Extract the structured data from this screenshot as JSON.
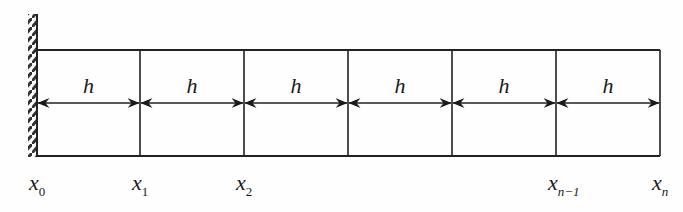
{
  "diagram": {
    "colors": {
      "line": "#222222",
      "background": "#fefefe"
    },
    "wall": {
      "x": 37,
      "y_top": 14,
      "y_bottom": 157,
      "hatch": "diagonal"
    },
    "box": {
      "left": 37,
      "right": 660,
      "top": 50,
      "bottom": 156
    },
    "arrow_y": 103,
    "cell_label": "h",
    "cells": [
      {
        "label": "h",
        "from": 37,
        "to": 140
      },
      {
        "label": "h",
        "from": 140,
        "to": 244
      },
      {
        "label": "h",
        "from": 244,
        "to": 348
      },
      {
        "label": "h",
        "from": 348,
        "to": 452
      },
      {
        "label": "h",
        "from": 452,
        "to": 556
      },
      {
        "label": "h",
        "from": 556,
        "to": 660
      }
    ],
    "nodes": [
      {
        "base": "x",
        "sub": "0",
        "x": 37
      },
      {
        "base": "x",
        "sub": "1",
        "x": 140
      },
      {
        "base": "x",
        "sub": "2",
        "x": 244
      },
      {
        "base": "x",
        "sub": "n−1",
        "x": 556
      },
      {
        "base": "x",
        "sub": "n",
        "x": 660
      }
    ]
  }
}
